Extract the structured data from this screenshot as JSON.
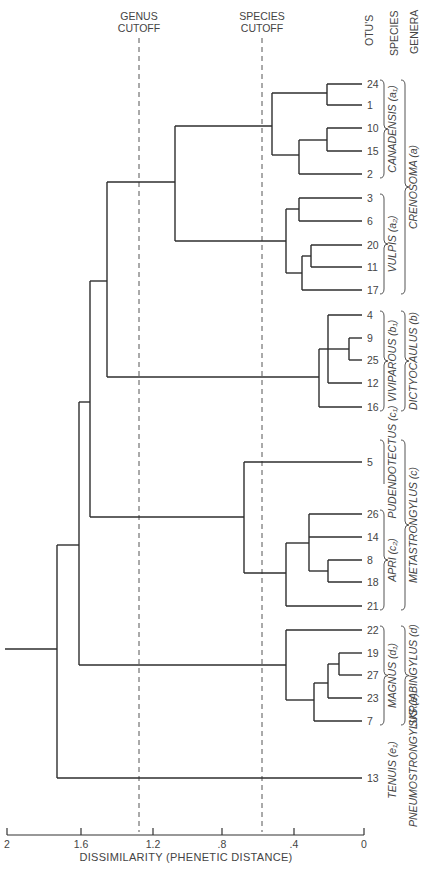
{
  "column_headers": [
    "OTU'S",
    "SPECIES",
    "GENERA"
  ],
  "cutoffs": [
    {
      "name": "genus",
      "line1": "GENUS",
      "line2": "CUTOFF",
      "x": 139
    },
    {
      "name": "species",
      "line1": "SPECIES",
      "line2": "CUTOFF",
      "x": 262
    }
  ],
  "axis": {
    "title": "DISSIMILARITY (PHENETIC DISTANCE)",
    "ticks": [
      {
        "label": "2",
        "x": 7
      },
      {
        "label": "1.6",
        "x": 81
      },
      {
        "label": "1.2",
        "x": 153
      },
      {
        "label": ".8",
        "x": 222
      },
      {
        "label": ".4",
        "x": 294
      },
      {
        "label": "0",
        "x": 364
      }
    ]
  },
  "leaves": [
    {
      "otu": "24",
      "y": 84
    },
    {
      "otu": "1",
      "y": 105
    },
    {
      "otu": "10",
      "y": 128
    },
    {
      "otu": "15",
      "y": 151
    },
    {
      "otu": "2",
      "y": 174
    },
    {
      "otu": "3",
      "y": 198
    },
    {
      "otu": "6",
      "y": 221
    },
    {
      "otu": "20",
      "y": 245
    },
    {
      "otu": "11",
      "y": 267
    },
    {
      "otu": "17",
      "y": 290
    },
    {
      "otu": "4",
      "y": 315
    },
    {
      "otu": "9",
      "y": 338
    },
    {
      "otu": "25",
      "y": 360
    },
    {
      "otu": "12",
      "y": 383
    },
    {
      "otu": "16",
      "y": 407
    },
    {
      "otu": "5",
      "y": 462
    },
    {
      "otu": "26",
      "y": 514
    },
    {
      "otu": "14",
      "y": 537
    },
    {
      "otu": "8",
      "y": 560
    },
    {
      "otu": "18",
      "y": 582
    },
    {
      "otu": "21",
      "y": 606
    },
    {
      "otu": "22",
      "y": 630
    },
    {
      "otu": "19",
      "y": 653
    },
    {
      "otu": "27",
      "y": 675
    },
    {
      "otu": "23",
      "y": 698
    },
    {
      "otu": "7",
      "y": 721
    },
    {
      "otu": "13",
      "y": 778
    }
  ],
  "nodes": [
    {
      "x": 327,
      "y1": 84,
      "y2": 105,
      "children_join": [
        [
          84,
          362
        ],
        [
          105,
          362
        ]
      ]
    },
    {
      "x": 327,
      "y1": 128,
      "y2": 151,
      "children_join": [
        [
          128,
          362
        ],
        [
          151,
          362
        ]
      ]
    },
    {
      "x": 299,
      "y1": 140,
      "y2": 174,
      "children_join": [
        [
          140,
          327
        ],
        [
          174,
          362
        ]
      ]
    },
    {
      "x": 272,
      "y1": 93,
      "y2": 155,
      "children_join": [
        [
          93,
          327
        ],
        [
          155,
          299
        ]
      ]
    },
    {
      "x": 299,
      "y1": 198,
      "y2": 221,
      "children_join": [
        [
          198,
          362
        ],
        [
          221,
          362
        ]
      ]
    },
    {
      "x": 311,
      "y1": 245,
      "y2": 267,
      "children_join": [
        [
          245,
          362
        ],
        [
          267,
          362
        ]
      ]
    },
    {
      "x": 302,
      "y1": 256,
      "y2": 290,
      "children_join": [
        [
          256,
          311
        ],
        [
          290,
          362
        ]
      ]
    },
    {
      "x": 286,
      "y1": 209,
      "y2": 273,
      "children_join": [
        [
          209,
          299
        ],
        [
          273,
          302
        ]
      ]
    },
    {
      "x": 175,
      "y1": 126,
      "y2": 241,
      "children_join": [
        [
          126,
          272
        ],
        [
          241,
          286
        ]
      ]
    },
    {
      "x": 349,
      "y1": 338,
      "y2": 360,
      "children_join": [
        [
          338,
          362
        ],
        [
          360,
          362
        ]
      ]
    },
    {
      "x": 328,
      "y1": 315,
      "y2": 383,
      "children_join": [
        [
          315,
          362
        ],
        [
          349,
          349
        ],
        [
          383,
          362
        ]
      ]
    },
    {
      "x": 319,
      "y1": 349,
      "y2": 407,
      "children_join": [
        [
          349,
          328
        ],
        [
          407,
          362
        ]
      ]
    },
    {
      "x": 107,
      "y1": 182,
      "y2": 377,
      "children_join": [
        [
          182,
          175
        ],
        [
          377,
          319
        ]
      ]
    },
    {
      "x": 328,
      "y1": 560,
      "y2": 582,
      "children_join": [
        [
          560,
          362
        ],
        [
          582,
          362
        ]
      ]
    },
    {
      "x": 309,
      "y1": 514,
      "y2": 571,
      "children_join": [
        [
          514,
          362
        ],
        [
          537,
          362
        ],
        [
          571,
          328
        ]
      ]
    },
    {
      "x": 286,
      "y1": 543,
      "y2": 606,
      "children_join": [
        [
          543,
          309
        ],
        [
          606,
          362
        ]
      ]
    },
    {
      "x": 244,
      "y1": 462,
      "y2": 573,
      "children_join": [
        [
          462,
          362
        ],
        [
          573,
          286
        ]
      ]
    },
    {
      "x": 90,
      "y1": 281,
      "y2": 517,
      "children_join": [
        [
          281,
          107
        ],
        [
          517,
          244
        ]
      ]
    },
    {
      "x": 339,
      "y1": 653,
      "y2": 675,
      "children_join": [
        [
          653,
          362
        ],
        [
          675,
          362
        ]
      ]
    },
    {
      "x": 328,
      "y1": 664,
      "y2": 698,
      "children_join": [
        [
          664,
          339
        ],
        [
          698,
          362
        ]
      ]
    },
    {
      "x": 314,
      "y1": 683,
      "y2": 721,
      "children_join": [
        [
          683,
          328
        ],
        [
          721,
          362
        ]
      ]
    },
    {
      "x": 286,
      "y1": 630,
      "y2": 700,
      "children_join": [
        [
          630,
          362
        ],
        [
          700,
          314
        ]
      ]
    },
    {
      "x": 79,
      "y1": 402,
      "y2": 665,
      "children_join": [
        [
          402,
          90
        ],
        [
          665,
          286
        ]
      ]
    },
    {
      "x": 57,
      "y1": 545,
      "y2": 778,
      "children_join": [
        [
          545,
          79
        ],
        [
          778,
          362
        ]
      ]
    }
  ],
  "root_stem": {
    "x1": 5,
    "x2": 57,
    "y": 649
  },
  "species_groups": [
    {
      "label": "CANADENSIS (a₁)",
      "y1": 80,
      "y2": 178
    },
    {
      "label": "VULPIS (a₂)",
      "y1": 194,
      "y2": 294
    },
    {
      "label": "VIVIPAROUS (b₁)",
      "y1": 311,
      "y2": 411
    },
    {
      "label": "PUDENDOTECTUS (c₁)",
      "y1": 440,
      "y2": 484,
      "open": true
    },
    {
      "label": "APRI (c₂)",
      "y1": 510,
      "y2": 610
    },
    {
      "label": "MAGNUS (d₁)",
      "y1": 626,
      "y2": 725
    },
    {
      "label": "TENUIS (e₁)",
      "y1": 740,
      "y2": 810,
      "open": true
    }
  ],
  "genus_groups": [
    {
      "label": "CRENOSOMA (a)",
      "y1": 80,
      "y2": 294
    },
    {
      "label": "DICTYOCAULUS (b)",
      "y1": 311,
      "y2": 411
    },
    {
      "label": "METASTRONGYLUS (c)",
      "y1": 440,
      "y2": 610
    },
    {
      "label": "SKRJABINGYLUS (d)",
      "y1": 626,
      "y2": 725
    },
    {
      "label": "PNEUMOSTRONGYLUS (e)",
      "y1": 740,
      "y2": 835,
      "open": true
    }
  ]
}
